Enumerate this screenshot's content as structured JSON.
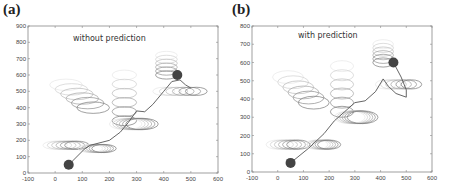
{
  "chart_data": [
    {
      "type": "scatter",
      "panel_label": "(a)",
      "annotation": "without prediction",
      "xlim": [
        -100,
        600
      ],
      "ylim": [
        0,
        900
      ],
      "xticks": [
        -100,
        0,
        100,
        200,
        300,
        400,
        500,
        600
      ],
      "yticks": [
        0,
        100,
        200,
        300,
        400,
        500,
        600,
        700,
        800,
        900
      ],
      "grid": false,
      "start_point": {
        "x": 50,
        "y": 50
      },
      "goal_point": {
        "x": 450,
        "y": 600
      },
      "path": [
        [
          50,
          50
        ],
        [
          110,
          150
        ],
        [
          130,
          170
        ],
        [
          200,
          200
        ],
        [
          240,
          250
        ],
        [
          270,
          310
        ],
        [
          300,
          380
        ],
        [
          330,
          375
        ],
        [
          360,
          420
        ],
        [
          400,
          500
        ],
        [
          430,
          560
        ],
        [
          460,
          570
        ],
        [
          480,
          540
        ],
        [
          500,
          520
        ]
      ],
      "obstacle_groups": [
        {
          "name": "lower-left",
          "cx_range": [
            0,
            80
          ],
          "cy": 170,
          "rx": 45,
          "ry": 25
        },
        {
          "name": "lower-mid",
          "cx_range": [
            130,
            180
          ],
          "cy": 150,
          "rx": 45,
          "ry": 25
        },
        {
          "name": "upper-left",
          "cx_range": [
            40,
            140
          ],
          "cy_range": [
            540,
            400
          ],
          "rx": 60,
          "ry": 35
        },
        {
          "name": "center-column",
          "cx": 255,
          "cy_range": [
            600,
            320
          ],
          "rx": 45,
          "ry": 30
        },
        {
          "name": "center-low",
          "cx_range": [
            260,
            320
          ],
          "cy": 300,
          "rx": 60,
          "ry": 35
        },
        {
          "name": "upper-right",
          "cx": 410,
          "cy_range": [
            720,
            600
          ],
          "rx": 40,
          "ry": 25
        },
        {
          "name": "right",
          "cx_range": [
            400,
            520
          ],
          "cy": 500,
          "rx": 40,
          "ry": 25
        }
      ]
    },
    {
      "type": "scatter",
      "panel_label": "(b)",
      "annotation": "with prediction",
      "xlim": [
        -100,
        600
      ],
      "ylim": [
        0,
        800
      ],
      "xticks": [
        -100,
        0,
        100,
        200,
        300,
        400,
        500,
        600
      ],
      "yticks": [
        0,
        100,
        200,
        300,
        400,
        500,
        600,
        700,
        800
      ],
      "grid": false,
      "start_point": {
        "x": 50,
        "y": 50
      },
      "goal_point": {
        "x": 450,
        "y": 600
      },
      "path": [
        [
          50,
          50
        ],
        [
          120,
          130
        ],
        [
          180,
          210
        ],
        [
          220,
          280
        ],
        [
          260,
          330
        ],
        [
          300,
          380
        ],
        [
          340,
          390
        ],
        [
          380,
          440
        ],
        [
          410,
          510
        ],
        [
          430,
          470
        ],
        [
          460,
          430
        ],
        [
          500,
          410
        ],
        [
          500,
          450
        ],
        [
          480,
          520
        ],
        [
          450,
          600
        ]
      ],
      "obstacle_groups": [
        {
          "name": "lower-left",
          "cx_range": [
            0,
            80
          ],
          "cy": 150,
          "rx": 45,
          "ry": 25
        },
        {
          "name": "lower-mid",
          "cx_range": [
            150,
            200
          ],
          "cy": 150,
          "rx": 45,
          "ry": 25
        },
        {
          "name": "upper-left",
          "cx_range": [
            40,
            140
          ],
          "cy_range": [
            520,
            380
          ],
          "rx": 60,
          "ry": 35
        },
        {
          "name": "center-column",
          "cx": 250,
          "cy_range": [
            580,
            330
          ],
          "rx": 45,
          "ry": 30
        },
        {
          "name": "center-low",
          "cx_range": [
            280,
            330
          ],
          "cy": 300,
          "rx": 60,
          "ry": 35
        },
        {
          "name": "upper-right",
          "cx": 410,
          "cy_range": [
            700,
            600
          ],
          "rx": 40,
          "ry": 25
        },
        {
          "name": "right",
          "cx_range": [
            420,
            520
          ],
          "cy": 480,
          "rx": 40,
          "ry": 25
        }
      ]
    }
  ]
}
